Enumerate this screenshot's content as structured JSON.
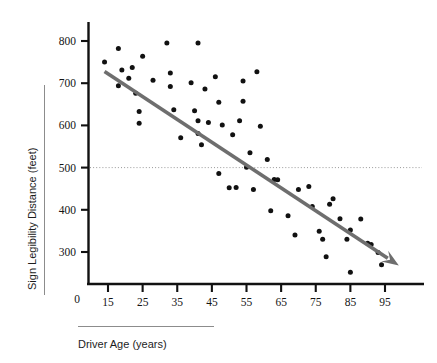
{
  "chart_data": {
    "type": "scatter",
    "title": "",
    "xlabel": "Driver Age (years)",
    "ylabel": "Sign Legibility Distance (feet)",
    "xlim": [
      10,
      102
    ],
    "ylim": [
      200,
      830
    ],
    "x_ticks": [
      15,
      25,
      35,
      45,
      55,
      65,
      75,
      85,
      95
    ],
    "y_ticks": [
      300,
      400,
      500,
      600,
      700,
      800
    ],
    "origin_label": "0",
    "grid": false,
    "legend": "none",
    "reference_line": {
      "axis": "y",
      "value": 500,
      "style": "dotted",
      "color": "#999999"
    },
    "trend_line": {
      "label": "",
      "style": "solid-arrow",
      "color": "#6e6e6e",
      "x_start": 14,
      "y_start": 728,
      "x_end": 99,
      "y_end": 268
    },
    "series": [
      {
        "name": "Drivers",
        "marker": "filled-circle",
        "color": "#111111",
        "points": [
          [
            14,
            750
          ],
          [
            18,
            782
          ],
          [
            18,
            694
          ],
          [
            19,
            731
          ],
          [
            21,
            712
          ],
          [
            22,
            737
          ],
          [
            23,
            676
          ],
          [
            24,
            633
          ],
          [
            24,
            605
          ],
          [
            25,
            764
          ],
          [
            28,
            707
          ],
          [
            32,
            795
          ],
          [
            33,
            724
          ],
          [
            33,
            692
          ],
          [
            34,
            637
          ],
          [
            36,
            571
          ],
          [
            39,
            701
          ],
          [
            40,
            635
          ],
          [
            41,
            795
          ],
          [
            41,
            611
          ],
          [
            41,
            581
          ],
          [
            42,
            554
          ],
          [
            43,
            686
          ],
          [
            44,
            607
          ],
          [
            46,
            715
          ],
          [
            47,
            655
          ],
          [
            47,
            486
          ],
          [
            48,
            601
          ],
          [
            50,
            452
          ],
          [
            51,
            578
          ],
          [
            52,
            453
          ],
          [
            53,
            611
          ],
          [
            54,
            705
          ],
          [
            54,
            657
          ],
          [
            55,
            501
          ],
          [
            56,
            535
          ],
          [
            57,
            448
          ],
          [
            58,
            727
          ],
          [
            59,
            598
          ],
          [
            61,
            519
          ],
          [
            62,
            398
          ],
          [
            63,
            472
          ],
          [
            64,
            471
          ],
          [
            67,
            386
          ],
          [
            69,
            340
          ],
          [
            70,
            448
          ],
          [
            73,
            455
          ],
          [
            74,
            408
          ],
          [
            76,
            349
          ],
          [
            77,
            330
          ],
          [
            78,
            289
          ],
          [
            79,
            413
          ],
          [
            80,
            426
          ],
          [
            82,
            379
          ],
          [
            84,
            330
          ],
          [
            85,
            352
          ],
          [
            85,
            252
          ],
          [
            88,
            378
          ],
          [
            90,
            321
          ],
          [
            91,
            318
          ],
          [
            93,
            299
          ],
          [
            94,
            270
          ]
        ]
      }
    ]
  },
  "axes": {
    "y_axis_name": "y-axis",
    "x_axis_name": "x-axis"
  }
}
